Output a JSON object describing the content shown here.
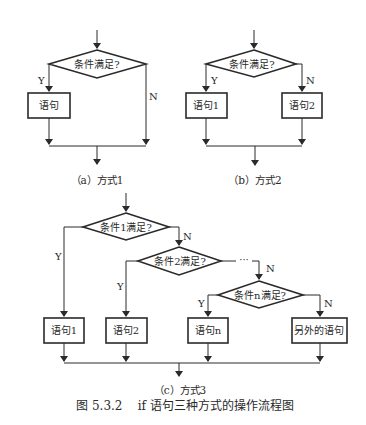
{
  "figure": {
    "title": "图 5.3.2    if 语句三种方式的操作流程图"
  },
  "diagram_a": {
    "caption": "（a）方式1",
    "condition": "条件满足?",
    "statement": "语句",
    "yes_label": "Y",
    "no_label": "N"
  },
  "diagram_b": {
    "caption": "（b）方式2",
    "condition": "条件满足?",
    "statement1": "语句1",
    "statement2": "语句2",
    "yes_label": "Y",
    "no_label": "N"
  },
  "diagram_c": {
    "caption": "（c）方式3",
    "condition1": "条件1满足?",
    "condition2": "条件2满足?",
    "condition_n": "条件n满足?",
    "ellipsis": "···",
    "statement1": "语句1",
    "statement2": "语句2",
    "statement_n": "语句n",
    "statement_else": "另外的语句",
    "yes_label": "Y",
    "no_label": "N"
  },
  "colors": {
    "stroke": "#2a2a2a",
    "background": "#ffffff"
  }
}
